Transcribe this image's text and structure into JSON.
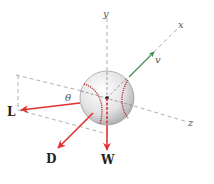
{
  "diagram": {
    "title": "",
    "axes": {
      "x": {
        "label": "x"
      },
      "y": {
        "label": "y"
      },
      "z": {
        "label": "z"
      }
    },
    "velocity": {
      "label": "v",
      "color": "#3a8a4a"
    },
    "forces": {
      "lift": {
        "label": "L",
        "color": "#e03030"
      },
      "drag": {
        "label": "D",
        "color": "#e03030"
      },
      "weight": {
        "label": "W",
        "color": "#e03030"
      }
    },
    "angle": {
      "label": "θ"
    },
    "colors": {
      "axis": "#9a9a9a",
      "ball": "#e6e6e8",
      "seam": "#b53a3a"
    }
  }
}
